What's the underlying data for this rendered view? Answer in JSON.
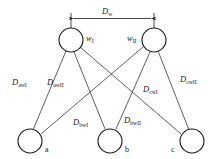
{
  "figure": {
    "type": "bipartite-distance-diagram",
    "background": "#ffffff",
    "stroke": "#1a1a1a"
  },
  "dimension": {
    "label_base": "D",
    "label_sub": "w",
    "full": "Dw"
  },
  "top_nodes": [
    {
      "id": "wI",
      "label_base": "w",
      "label_sub": "I",
      "full": "wI",
      "cx": 71,
      "cy": 40,
      "r": 12,
      "label_side": "right"
    },
    {
      "id": "wII",
      "label_base": "w",
      "label_sub": "II",
      "full": "wII",
      "cx": 154,
      "cy": 40,
      "r": 12,
      "label_side": "left"
    }
  ],
  "bottom_nodes": [
    {
      "id": "a",
      "label": "a",
      "cx": 30,
      "cy": 141,
      "r": 12,
      "label_side": "right"
    },
    {
      "id": "b",
      "label": "b",
      "cx": 110,
      "cy": 141,
      "r": 12,
      "label_side": "right"
    },
    {
      "id": "c",
      "label": "c",
      "cx": 192,
      "cy": 141,
      "r": 12,
      "label_side": "left"
    }
  ],
  "edges": [
    {
      "from": "a",
      "to": "wI",
      "label_base": "D",
      "label_sub": "awI",
      "full": "DawI"
    },
    {
      "from": "a",
      "to": "wII",
      "label_base": "D",
      "label_sub": "awII",
      "full": "DawII"
    },
    {
      "from": "b",
      "to": "wI",
      "label_base": "D",
      "label_sub": "bwI",
      "full": "DbwI"
    },
    {
      "from": "b",
      "to": "wII",
      "label_base": "D",
      "label_sub": "bwII",
      "full": "DbwII"
    },
    {
      "from": "c",
      "to": "wI",
      "label_base": "D",
      "label_sub": "cwI",
      "full": "DcwI"
    },
    {
      "from": "c",
      "to": "wII",
      "label_base": "D",
      "label_sub": "cwII",
      "full": "DcwII"
    }
  ]
}
